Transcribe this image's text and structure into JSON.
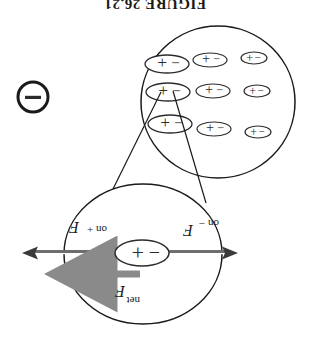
{
  "figure": {
    "orientation_note": "upside-down",
    "caption_fragment": "FIGURE 26.21",
    "background_color": "#ffffff",
    "ink_color": "#1a1a1a",
    "gray_arrow_color": "#8a8a8a"
  },
  "magnified_view": {
    "name": "magnified-dipole-circle",
    "dipole": {
      "negative_label": "−",
      "positive_label": "+"
    },
    "forces": [
      {
        "id": "force-on-negative",
        "label_base": "F",
        "label_sub": "on −",
        "direction": "left",
        "style": "outline-double-line"
      },
      {
        "id": "force-on-positive",
        "label_base": "F",
        "label_sub": "on +",
        "direction": "right",
        "style": "outline-double-line"
      },
      {
        "id": "force-net",
        "label_base": "F",
        "label_sub": "net",
        "direction": "right",
        "style": "solid-gray"
      }
    ]
  },
  "bulk_object": {
    "name": "polarized-object-circle",
    "dipole_symbols": {
      "negative_label": "−",
      "positive_label": "+"
    },
    "rows": [
      [
        {
          "col": 1,
          "rx": 13,
          "ry": 6
        },
        {
          "col": 2,
          "rx": 17,
          "ry": 7
        },
        {
          "col": 3,
          "rx": 22,
          "ry": 9
        }
      ],
      [
        {
          "col": 1,
          "rx": 13,
          "ry": 6
        },
        {
          "col": 2,
          "rx": 17,
          "ry": 7
        },
        {
          "col": 3,
          "rx": 22,
          "ry": 9
        }
      ],
      [
        {
          "col": 1,
          "rx": 13,
          "ry": 6
        },
        {
          "col": 2,
          "rx": 17,
          "ry": 7
        },
        {
          "col": 3,
          "rx": 22,
          "ry": 9
        }
      ]
    ]
  },
  "point_charge": {
    "name": "external-negative-point-charge",
    "label": "−"
  },
  "connectors": {
    "name": "magnifier-callout-lines",
    "count": 2
  }
}
